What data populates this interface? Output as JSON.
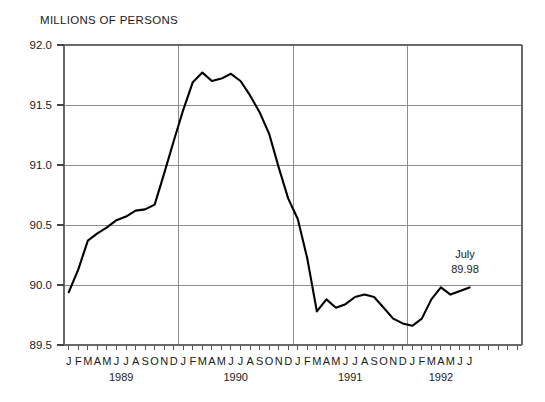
{
  "chart_data": {
    "type": "line",
    "title": "MILLIONS OF PERSONS",
    "xlabel": "",
    "ylabel": "",
    "ylim": [
      89.5,
      92.0
    ],
    "ytick_labels": [
      "92.0",
      "91.5",
      "91.0",
      "90.5",
      "90.0",
      "89.5"
    ],
    "ytick_values": [
      92.0,
      91.5,
      91.0,
      90.5,
      90.0,
      89.5
    ],
    "grid": true,
    "legend": "none",
    "month_labels": [
      "J",
      "F",
      "M",
      "A",
      "M",
      "J",
      "J",
      "A",
      "S",
      "O",
      "N",
      "D"
    ],
    "year_labels": [
      "1989",
      "1990",
      "1991",
      "1992"
    ],
    "x": [
      "1989-01",
      "1989-02",
      "1989-03",
      "1989-04",
      "1989-05",
      "1989-06",
      "1989-07",
      "1989-08",
      "1989-09",
      "1989-10",
      "1989-11",
      "1989-12",
      "1990-01",
      "1990-02",
      "1990-03",
      "1990-04",
      "1990-05",
      "1990-06",
      "1990-07",
      "1990-08",
      "1990-09",
      "1990-10",
      "1990-11",
      "1990-12",
      "1991-01",
      "1991-02",
      "1991-03",
      "1991-04",
      "1991-05",
      "1991-06",
      "1991-07",
      "1991-08",
      "1991-09",
      "1991-10",
      "1991-11",
      "1991-12",
      "1992-01",
      "1992-02",
      "1992-03",
      "1992-04",
      "1992-05",
      "1992-06",
      "1992-07"
    ],
    "values": [
      89.94,
      90.13,
      90.37,
      90.43,
      90.48,
      90.54,
      90.57,
      90.62,
      90.63,
      90.67,
      90.93,
      91.2,
      91.46,
      91.69,
      91.77,
      91.7,
      91.72,
      91.76,
      91.7,
      91.58,
      91.44,
      91.26,
      90.98,
      90.72,
      90.55,
      90.22,
      89.78,
      89.88,
      89.81,
      89.84,
      89.9,
      89.92,
      89.9,
      89.81,
      89.72,
      89.68,
      89.66,
      89.72,
      89.88,
      89.98,
      89.92,
      89.95,
      89.98
    ],
    "annotation": {
      "label": "July",
      "value": "89.98"
    },
    "colors": {
      "line": "#000000",
      "grid": "#8d8d8d",
      "axis": "#6a6a6a",
      "text": "#1a1a1a",
      "background": "#ffffff"
    }
  }
}
